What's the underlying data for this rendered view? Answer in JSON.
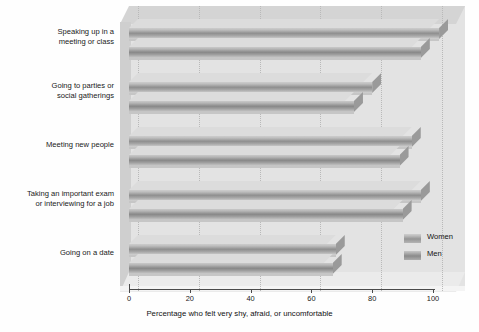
{
  "chart_data": {
    "type": "bar",
    "orientation": "horizontal",
    "title": "",
    "xlabel": "Percentage who felt very shy, afraid, or uncomfortable",
    "ylabel": "",
    "xlim": [
      0,
      100
    ],
    "xticks": [
      0,
      20,
      40,
      60,
      80,
      100
    ],
    "grid": true,
    "grid_axis": "x",
    "legend_position": "lower-right",
    "style": "3d-grayscale-horizontal-bars",
    "categories": [
      "Speaking up in a meeting or class",
      "Going to parties or social gatherings",
      "Meeting new people",
      "Taking an important exam or interviewing for a job",
      "Going on a date"
    ],
    "series": [
      {
        "name": "Women",
        "color": "#9a9a9a",
        "values": [
          102,
          80,
          93,
          96,
          68
        ]
      },
      {
        "name": "Men",
        "color": "#8a8a8a",
        "values": [
          96,
          74,
          89,
          90,
          67
        ]
      }
    ]
  },
  "axis": {
    "tick_labels": [
      "0",
      "20",
      "40",
      "60",
      "80",
      "100"
    ],
    "title": "Percentage who felt very shy, afraid, or uncomfortable"
  },
  "categories": [
    {
      "line1": "Speaking up in a",
      "line2": "meeting or class"
    },
    {
      "line1": "Going to parties or",
      "line2": "social gatherings"
    },
    {
      "line1": "Meeting new people",
      "line2": ""
    },
    {
      "line1": "Taking an important exam",
      "line2": "or interviewing for a job"
    },
    {
      "line1": "Going on a date",
      "line2": ""
    }
  ],
  "legend": {
    "items": [
      {
        "label": "Women"
      },
      {
        "label": "Men"
      }
    ]
  }
}
